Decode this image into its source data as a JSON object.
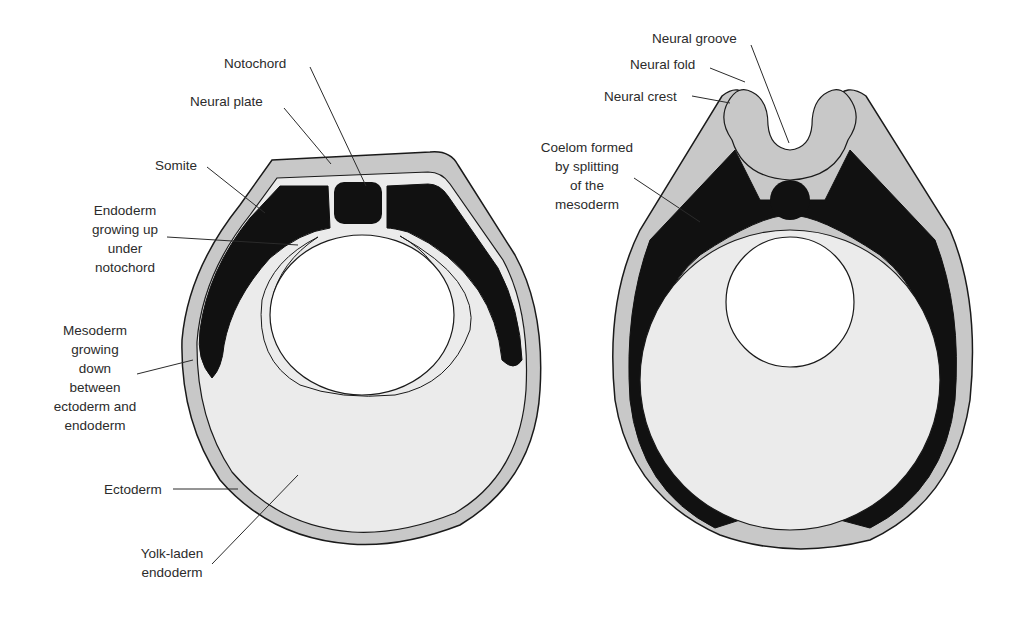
{
  "figure": {
    "colors": {
      "background": "#ffffff",
      "ectoderm_fill": "#c8c8c8",
      "mesoderm_fill": "#111111",
      "yolk_fill": "#ebebeb",
      "outline": "#1a1a1a",
      "label_text": "#2b2b2b"
    },
    "left_diagram": {
      "labels": {
        "notochord": "Notochord",
        "neural_plate": "Neural plate",
        "somite": "Somite",
        "endoderm_up": [
          "Endoderm",
          "growing up",
          "under",
          "notochord"
        ],
        "mesoderm_down": [
          "Mesoderm",
          "growing",
          "down",
          "between",
          "ectoderm and",
          "endoderm"
        ],
        "ectoderm": "Ectoderm",
        "yolk": [
          "Yolk-laden",
          "endoderm"
        ]
      }
    },
    "right_diagram": {
      "labels": {
        "neural_groove": "Neural groove",
        "neural_fold": "Neural fold",
        "neural_crest": "Neural crest",
        "coelom": [
          "Coelom formed",
          "by splitting",
          "of the",
          "mesoderm"
        ]
      }
    }
  }
}
